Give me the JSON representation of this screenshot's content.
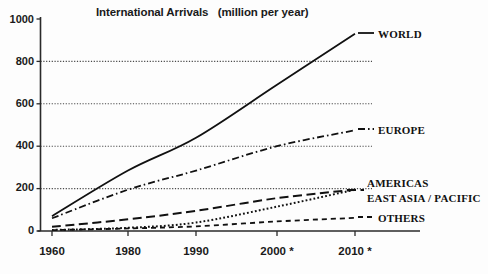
{
  "chart_data": {
    "type": "line",
    "title": "International Arrivals   (million per year)",
    "xlabel": "",
    "ylabel": "",
    "ylim": [
      0,
      1000
    ],
    "yticks": [
      0,
      200,
      400,
      600,
      800,
      1000
    ],
    "xticks": [
      "1960",
      "1980",
      "1990",
      "2000 *",
      "2010 *"
    ],
    "x": [
      1960,
      1980,
      1990,
      2000,
      2010
    ],
    "grid": "horizontal-dotted",
    "legend_position": "right-inline",
    "note": "* indicates forecast/estimated years",
    "series": [
      {
        "name": "WORLD",
        "style": "solid",
        "values": [
          70,
          285,
          440,
          690,
          930
        ],
        "label": "WORLD"
      },
      {
        "name": "EUROPE",
        "style": "dash-dot",
        "values": [
          60,
          195,
          285,
          400,
          475
        ],
        "label": "EUROPE"
      },
      {
        "name": "AMERICAS",
        "style": "long-dash",
        "values": [
          20,
          55,
          95,
          155,
          195
        ],
        "label": "AMERICAS"
      },
      {
        "name": "EAST ASIA / PACIFIC",
        "style": "dotted",
        "values": [
          5,
          15,
          40,
          115,
          195
        ],
        "label": "EAST ASIA / PACIFIC"
      },
      {
        "name": "OTHERS",
        "style": "short-dash",
        "values": [
          4,
          12,
          22,
          45,
          62
        ],
        "label": "OTHERS"
      }
    ]
  },
  "axis": {
    "y_labels": [
      "1000",
      "800",
      "600",
      "400",
      "200",
      "0"
    ],
    "x_labels": [
      "1960",
      "1980",
      "1990",
      "2000 *",
      "2010 *"
    ]
  },
  "colors": {
    "ink": "#1a1a1a",
    "grid": "#4a4a4a",
    "background": "#fdfdfd"
  }
}
